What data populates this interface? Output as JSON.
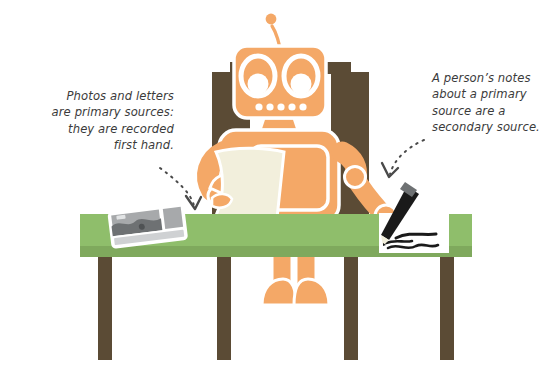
{
  "illustration": {
    "title": "Robot at desk with camera, letter and notepad",
    "subject": "primary and secondary sources"
  },
  "annotations": {
    "left": {
      "text": "Photos and letters\nare primary sources:\nthey are recorded\nfirst hand.",
      "arrow": "dotted-curved-arrow-down-right",
      "points_to": "camera-on-table"
    },
    "right": {
      "text": "A person’s notes\nabout a primary\nsource are a\nsecondary source.",
      "arrow": "dotted-curved-arrow-down-left",
      "points_to": "notepad-with-pencil"
    }
  },
  "scene": {
    "background": "#ffffff",
    "robot": {
      "name": "orange-robot",
      "body_color": "#F4A867",
      "outline_color": "#ffffff",
      "parts": [
        "antenna",
        "head",
        "eye-left",
        "eye-right",
        "mouth-dots",
        "neck",
        "torso",
        "chest-panel",
        "arm-left",
        "hand-left",
        "arm-right",
        "hand-right",
        "leg-left",
        "leg-right",
        "foot-left",
        "foot-right"
      ],
      "mouth_dot_count": 5
    },
    "chair": {
      "name": "chair",
      "color": "#5B4B35"
    },
    "table": {
      "name": "table",
      "top_color": "#8FBE6B",
      "edge_color": "#7FA95D",
      "leg_color": "#5B4B35",
      "leg_count": 4
    },
    "camera": {
      "name": "camera",
      "body_color": "#A7A9AB",
      "detail_color": "#6E7173",
      "outline_color": "#ffffff"
    },
    "letter": {
      "name": "letter-paper",
      "color": "#F2EFDC"
    },
    "notepad": {
      "name": "notepad",
      "color": "#FFFFFF",
      "scribble_color": "#1A1A1A"
    },
    "pencil": {
      "name": "pencil",
      "body_color": "#1A1A1A",
      "ferrule_color": "#6E7173"
    },
    "arrow_color": "#4A4A4A"
  }
}
